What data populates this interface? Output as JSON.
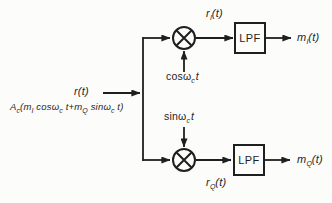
{
  "colors": {
    "ink": "#1f1f1f",
    "background": "#fcfcfa"
  },
  "input": {
    "signal": "r(t)",
    "formula": {
      "a": "A",
      "a_sub": "c",
      "open_m": "(m",
      "m1_sub": "I",
      "cos": " cosω",
      "cos_sub": "c",
      "t_plus_m": " t+m",
      "m2_sub": "Q",
      "sin": " sinω",
      "sin_sub": "c",
      "t_close": " t)"
    }
  },
  "top_branch": {
    "carrier": {
      "base": "cosω",
      "sub": "c",
      "rest": "t"
    },
    "mixer_output": {
      "base": "r",
      "sub": "I",
      "rest": "(t)"
    },
    "filter_label": "LPF",
    "output": {
      "base": "m",
      "sub": "I",
      "rest": "(t)"
    }
  },
  "bottom_branch": {
    "carrier": {
      "base": "sinω",
      "sub": "c",
      "rest": "t"
    },
    "mixer_output": {
      "base": "r",
      "sub": "Q",
      "rest": "(t)"
    },
    "filter_label": "LPF",
    "output": {
      "base": "m",
      "sub": "Q",
      "rest": "(t)"
    }
  }
}
